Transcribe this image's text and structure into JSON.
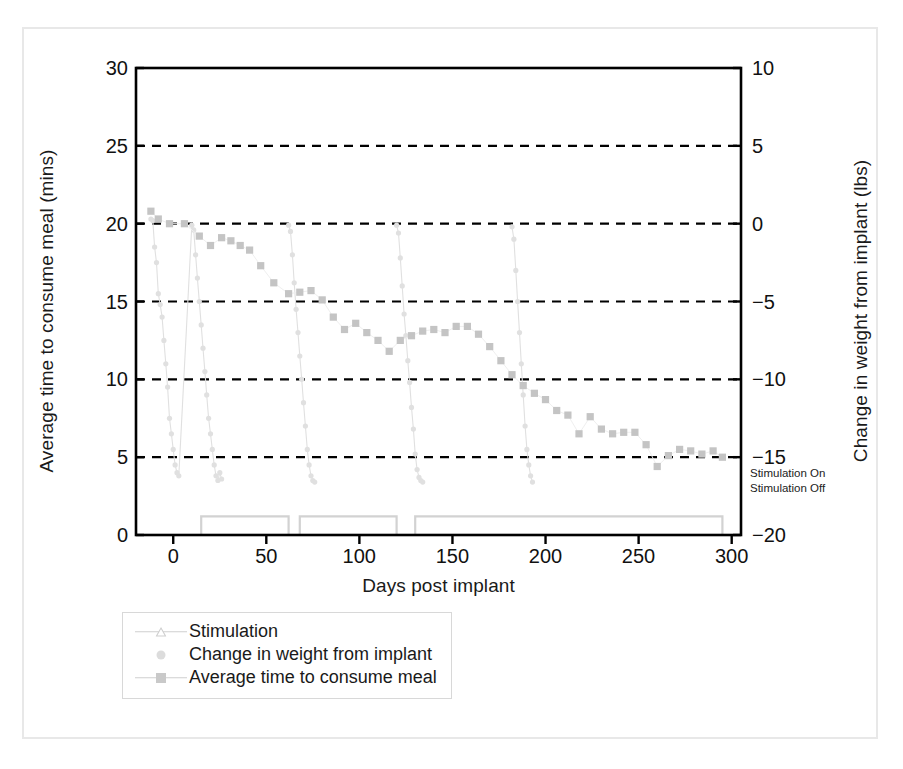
{
  "figure": {
    "background": "#ffffff",
    "frame_color": "#e8e8e8"
  },
  "chart_data": {
    "type": "line",
    "title": "",
    "xlabel": "Days post implant",
    "ylabel": "Average time to consume meal (mins)",
    "y2label": "Change in weight from implant (lbs)",
    "xlim": [
      -20,
      305
    ],
    "ylim": [
      0,
      30
    ],
    "y2lim": [
      -20,
      10
    ],
    "xticks": [
      0,
      50,
      100,
      150,
      200,
      250,
      300
    ],
    "yticks": [
      0,
      5,
      10,
      15,
      20,
      25,
      30
    ],
    "y2ticks": [
      -20,
      -15,
      -10,
      -5,
      0,
      5,
      10
    ],
    "grid": "horizontal dashed black at y = 0, 5, 10, 15, 20, 25",
    "legend_position": "below-left",
    "annotations": {
      "stim_on": "Stimulation On",
      "stim_off": "Stimulation Off",
      "stim_on_value_left_axis": 1.2,
      "stim_off_value_left_axis": 0.0
    },
    "colors": {
      "stimulation": "#d2d2d2",
      "weight": "#e0e0e0",
      "meal_time": "#c4c4c4",
      "axis": "#000000",
      "grid": "#000000",
      "text": "#1a1a1a"
    },
    "series": [
      {
        "name": "Stimulation",
        "axis": "left",
        "marker": "triangle",
        "style": "step",
        "x": [
          -15,
          15,
          15,
          62,
          62,
          68,
          68,
          120,
          120,
          130,
          130,
          295,
          295
        ],
        "values": [
          0,
          0,
          1.2,
          1.2,
          0,
          0,
          1.2,
          1.2,
          0,
          0,
          1.2,
          1.2,
          0
        ]
      },
      {
        "name": "Change in weight from implant",
        "axis": "right",
        "marker": "circle",
        "style": "points",
        "x": [
          -12,
          -11,
          -10,
          -9,
          -8,
          -7,
          -6,
          -5,
          -4,
          -3,
          -2,
          -1,
          0,
          1,
          2,
          3,
          10,
          11,
          12,
          13,
          14,
          15,
          16,
          17,
          18,
          19,
          20,
          21,
          22,
          23,
          24,
          25,
          26,
          62,
          63,
          64,
          65,
          66,
          67,
          68,
          69,
          70,
          71,
          72,
          73,
          74,
          75,
          76,
          120,
          121,
          122,
          123,
          124,
          125,
          126,
          127,
          128,
          129,
          130,
          131,
          132,
          133,
          134,
          182,
          183,
          184,
          185,
          186,
          187,
          188,
          189,
          190,
          191,
          192,
          193
        ],
        "values": [
          0.3,
          0.2,
          -1.5,
          -2.5,
          -4.5,
          -5.2,
          -6.0,
          -7.5,
          -9.0,
          -10.5,
          -12.5,
          -13.5,
          -14.5,
          -15.5,
          -16.0,
          -16.2,
          -0.1,
          -0.4,
          -2.0,
          -3.5,
          -5.0,
          -6.5,
          -8.0,
          -9.5,
          -11.0,
          -12.5,
          -13.5,
          -14.5,
          -15.5,
          -16.2,
          -16.5,
          -16.0,
          -16.4,
          -0.1,
          -0.5,
          -2.0,
          -3.8,
          -5.5,
          -7.0,
          -8.5,
          -10.0,
          -11.5,
          -13.0,
          -14.5,
          -15.5,
          -16.2,
          -16.5,
          -16.6,
          -0.1,
          -0.6,
          -2.2,
          -4.0,
          -5.8,
          -7.2,
          -8.8,
          -10.2,
          -11.8,
          -13.2,
          -14.8,
          -15.8,
          -16.3,
          -16.5,
          -16.6,
          -0.2,
          -1.0,
          -3.0,
          -5.0,
          -7.0,
          -9.0,
          -11.0,
          -13.0,
          -14.5,
          -15.5,
          -16.2,
          -16.6
        ]
      },
      {
        "name": "Average time to consume meal",
        "axis": "left",
        "marker": "square",
        "style": "points",
        "x": [
          -12,
          -8,
          -2,
          6,
          14,
          20,
          26,
          31,
          36,
          41,
          47,
          54,
          62,
          68,
          74,
          80,
          86,
          92,
          98,
          104,
          110,
          116,
          122,
          128,
          134,
          140,
          146,
          152,
          158,
          164,
          170,
          176,
          182,
          188,
          194,
          200,
          206,
          212,
          218,
          224,
          230,
          236,
          242,
          248,
          254,
          260,
          266,
          272,
          278,
          284,
          290,
          295
        ],
        "values": [
          20.8,
          20.3,
          20.0,
          20.0,
          19.2,
          18.6,
          19.1,
          18.9,
          18.6,
          18.3,
          17.3,
          16.2,
          15.5,
          15.6,
          15.7,
          15.1,
          14.0,
          13.2,
          13.6,
          13.0,
          12.5,
          11.8,
          12.5,
          12.8,
          13.1,
          13.2,
          13.0,
          13.4,
          13.4,
          12.9,
          12.1,
          11.2,
          10.3,
          9.6,
          9.1,
          8.7,
          8.0,
          7.7,
          6.5,
          7.6,
          6.8,
          6.5,
          6.6,
          6.6,
          5.8,
          4.4,
          5.1,
          5.5,
          5.4,
          5.2,
          5.4,
          5.0
        ]
      }
    ]
  },
  "axes": {
    "left_ticks": [
      "30",
      "25",
      "20",
      "15",
      "10",
      "5",
      "0"
    ],
    "right_ticks": [
      "10",
      "5",
      "0",
      "−5",
      "−10",
      "−15",
      "−20"
    ],
    "x_ticks": [
      "0",
      "50",
      "100",
      "150",
      "200",
      "250",
      "300"
    ],
    "left_title": "Average time to consume meal (mins)",
    "right_title": "Change in weight from implant (lbs)",
    "x_title": "Days post implant"
  },
  "stim_labels": {
    "on": "Stimulation On",
    "off": "Stimulation Off"
  },
  "legend": {
    "items": [
      {
        "label": "Stimulation",
        "marker": "triangle-up-icon"
      },
      {
        "label": "Change in weight from implant",
        "marker": "circle-icon"
      },
      {
        "label": "Average time to consume meal",
        "marker": "square-icon"
      }
    ]
  }
}
